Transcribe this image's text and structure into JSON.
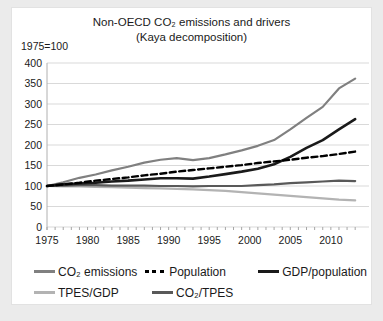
{
  "page": {
    "background": "#ebebeb",
    "panel_background": "#ffffff"
  },
  "header": {
    "title_line1": "Non-OECD CO₂ emissions and drivers",
    "title_line2": "(Kaya decomposition)",
    "index_note": "1975=100"
  },
  "chart_data": {
    "type": "line",
    "title": "Non-OECD CO₂ emissions and drivers (Kaya decomposition)",
    "index_base": "1975=100",
    "xlim": [
      1975,
      2013
    ],
    "ylim": [
      0,
      400
    ],
    "y_ticks": [
      0,
      50,
      100,
      150,
      200,
      250,
      300,
      350,
      400
    ],
    "x_ticks": [
      1975,
      1980,
      1985,
      1990,
      1995,
      2000,
      2005,
      2010
    ],
    "minor_x_tick_every": 1,
    "grid": "horizontal",
    "grid_color": "#d9d9d9",
    "axis_color": "#b0b0b0",
    "tick_color": "#a6a6a6",
    "label_color": "#1a1a1a",
    "legend_position": "bottom",
    "x": [
      1975,
      1977,
      1979,
      1981,
      1983,
      1985,
      1987,
      1989,
      1991,
      1993,
      1995,
      1997,
      1999,
      2001,
      2003,
      2005,
      2007,
      2009,
      2011,
      2013
    ],
    "series": [
      {
        "name": "CO₂ emissions",
        "color": "#808080",
        "style": "solid",
        "width": 2.2,
        "values": [
          100,
          109,
          120,
          128,
          138,
          147,
          157,
          164,
          168,
          163,
          168,
          177,
          187,
          198,
          212,
          238,
          266,
          293,
          338,
          362
        ]
      },
      {
        "name": "Population",
        "color": "#000000",
        "style": "dashed",
        "width": 2.4,
        "values": [
          100,
          104,
          108,
          113,
          117,
          121,
          126,
          130,
          135,
          139,
          143,
          147,
          151,
          156,
          160,
          164,
          169,
          173,
          178,
          184
        ]
      },
      {
        "name": "GDP/population",
        "color": "#1a1a1a",
        "style": "solid",
        "width": 2.6,
        "values": [
          100,
          104,
          106,
          108,
          111,
          113,
          116,
          119,
          119,
          118,
          123,
          129,
          135,
          142,
          153,
          171,
          193,
          212,
          238,
          263
        ]
      },
      {
        "name": "TPES/GDP",
        "color": "#b3b3b3",
        "style": "solid",
        "width": 2.2,
        "values": [
          100,
          99,
          99,
          98,
          97,
          96,
          95,
          94,
          93,
          92,
          90,
          88,
          85,
          82,
          79,
          76,
          73,
          70,
          67,
          65
        ]
      },
      {
        "name": "CO₂/TPES",
        "color": "#595959",
        "style": "solid",
        "width": 2.2,
        "values": [
          100,
          101,
          102,
          102,
          101,
          101,
          101,
          100,
          100,
          99,
          100,
          100,
          100,
          102,
          104,
          107,
          109,
          111,
          113,
          112
        ]
      }
    ],
    "draw_order": [
      3,
      4,
      0,
      2,
      1
    ]
  }
}
